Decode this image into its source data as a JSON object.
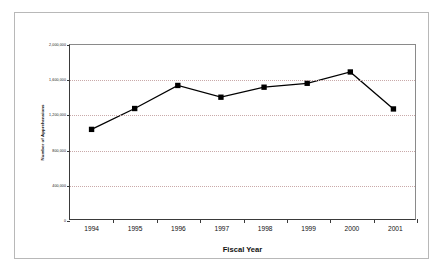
{
  "chart_data": {
    "type": "line",
    "title": "",
    "xlabel": "Fiscal Year",
    "ylabel": "Number of Apprehensions",
    "categories": [
      "1994",
      "1995",
      "1996",
      "1997",
      "1998",
      "1999",
      "2000",
      "2001"
    ],
    "values": [
      1030000,
      1270000,
      1535000,
      1400000,
      1515000,
      1560000,
      1690000,
      1265000
    ],
    "series": [
      {
        "name": "Number of Apprehensions",
        "values": [
          1030000,
          1270000,
          1535000,
          1400000,
          1515000,
          1560000,
          1690000,
          1265000
        ]
      }
    ],
    "ylim": [
      0,
      2000000
    ],
    "yticks": [
      0,
      400000,
      800000,
      1200000,
      1600000,
      2000000
    ],
    "ytick_labels": [
      "0",
      "400,000",
      "800,000",
      "1,200,000",
      "1,600,000",
      "2,000,000"
    ],
    "grid": true,
    "grid_axis": "y",
    "grid_style": "dotted",
    "grid_color": "#c9a9a9",
    "legend": false,
    "marker": "square",
    "marker_color": "#000000",
    "line_color": "#000000",
    "plot_background": "#ffffff",
    "border_color": "#b8b8b8"
  }
}
